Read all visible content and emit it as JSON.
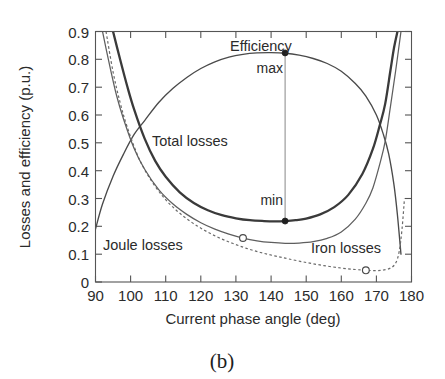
{
  "figure": {
    "caption": "(b)",
    "xlabel": "Current phase angle (deg)",
    "ylabel": "Losses and efficiency (p.u.)"
  },
  "annotations": {
    "efficiency": "Efficiency",
    "max": "max",
    "min": "min",
    "total_losses": "Total losses",
    "joule_losses": "Joule losses",
    "iron_losses": "Iron losses"
  },
  "ticks": {
    "x": [
      "90",
      "100",
      "110",
      "120",
      "130",
      "140",
      "150",
      "160",
      "170",
      "180"
    ],
    "y": [
      "0.9",
      "0.8",
      "0.7",
      "0.6",
      "0.5",
      "0.4",
      "0.3",
      "0.2",
      "0.1",
      "0"
    ]
  },
  "chart_data": {
    "type": "line",
    "title": "",
    "subtitle": "(b)",
    "xlabel": "Current phase angle (deg)",
    "ylabel": "Losses and efficiency (p.u.)",
    "xlim": [
      90,
      180
    ],
    "ylim": [
      0,
      0.9
    ],
    "xticks": [
      90,
      100,
      110,
      120,
      130,
      140,
      150,
      160,
      170,
      180
    ],
    "yticks": [
      0,
      0.1,
      0.2,
      0.3,
      0.4,
      0.5,
      0.6,
      0.7,
      0.8,
      0.9
    ],
    "grid": false,
    "legend": "inline-annotations",
    "series": [
      {
        "name": "Efficiency",
        "style": "solid-thin",
        "color": "#4a4a4a",
        "x": [
          90,
          92,
          95,
          98,
          101,
          104,
          108,
          112,
          116,
          120,
          124,
          128,
          132,
          136,
          140,
          144,
          148,
          152,
          156,
          160,
          164,
          167,
          170,
          172,
          173.5,
          175,
          176,
          177
        ],
        "y": [
          0.19,
          0.28,
          0.38,
          0.46,
          0.53,
          0.58,
          0.645,
          0.695,
          0.735,
          0.767,
          0.791,
          0.808,
          0.818,
          0.823,
          0.824,
          0.822,
          0.815,
          0.803,
          0.785,
          0.757,
          0.713,
          0.668,
          0.6,
          0.53,
          0.46,
          0.35,
          0.24,
          0.1
        ]
      },
      {
        "name": "Total losses",
        "style": "solid-thick",
        "color": "#3a3a3a",
        "x": [
          95,
          97,
          99,
          101,
          104,
          107,
          110,
          114,
          118,
          122,
          126,
          130,
          134,
          138,
          141,
          144,
          147,
          150,
          154,
          158,
          162,
          166,
          169,
          171,
          172.5,
          174,
          175,
          176
        ],
        "y": [
          0.9,
          0.8,
          0.705,
          0.62,
          0.515,
          0.435,
          0.378,
          0.322,
          0.284,
          0.258,
          0.24,
          0.229,
          0.222,
          0.219,
          0.218,
          0.219,
          0.222,
          0.228,
          0.243,
          0.269,
          0.313,
          0.388,
          0.478,
          0.565,
          0.64,
          0.76,
          0.84,
          0.9
        ]
      },
      {
        "name": "Joule losses",
        "style": "solid-thin",
        "color": "#5e5e5e",
        "x": [
          92,
          94,
          96,
          98,
          101,
          104,
          108,
          112,
          116,
          120,
          124,
          128,
          132,
          136,
          140,
          144,
          148,
          152,
          156,
          160,
          164,
          167,
          169,
          171,
          172.5,
          174,
          175.5,
          177
        ],
        "y": [
          0.9,
          0.78,
          0.67,
          0.585,
          0.48,
          0.405,
          0.332,
          0.281,
          0.243,
          0.213,
          0.19,
          0.172,
          0.158,
          0.148,
          0.142,
          0.139,
          0.14,
          0.145,
          0.157,
          0.18,
          0.226,
          0.283,
          0.338,
          0.425,
          0.505,
          0.63,
          0.76,
          0.9
        ]
      },
      {
        "name": "Iron losses",
        "style": "dashed",
        "color": "#6a6a6a",
        "x": [
          93,
          95,
          97,
          99,
          102,
          105,
          109,
          113,
          117,
          121,
          125,
          129,
          133,
          137,
          141,
          145,
          150,
          155,
          160,
          164,
          167,
          170,
          172,
          174,
          175.5,
          176.5,
          177.3,
          178
        ],
        "y": [
          0.9,
          0.755,
          0.645,
          0.558,
          0.455,
          0.382,
          0.31,
          0.258,
          0.218,
          0.186,
          0.16,
          0.139,
          0.121,
          0.106,
          0.094,
          0.083,
          0.07,
          0.059,
          0.05,
          0.045,
          0.042,
          0.041,
          0.043,
          0.05,
          0.068,
          0.11,
          0.19,
          0.3
        ]
      }
    ],
    "markers": [
      {
        "name": "efficiency-max",
        "label": "max",
        "x": 144,
        "y": 0.823,
        "style": "filled"
      },
      {
        "name": "total-losses-min",
        "label": "min",
        "x": 144,
        "y": 0.219,
        "style": "filled"
      },
      {
        "name": "joule-losses-point",
        "x": 132,
        "y": 0.158,
        "style": "open"
      },
      {
        "name": "iron-losses-point",
        "x": 167,
        "y": 0.042,
        "style": "open"
      }
    ],
    "connector": {
      "name": "max-min-vertical",
      "x": 144,
      "y_from": 0.823,
      "y_to": 0.219
    }
  }
}
